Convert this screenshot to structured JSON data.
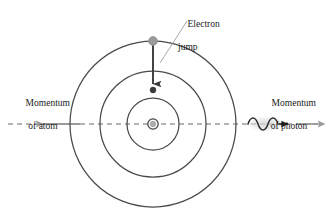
{
  "figure": {
    "background_color": "#ffffff",
    "width": 329,
    "height": 218
  },
  "labels": {
    "electron_jump": {
      "line1": "Electron",
      "line2": "jump"
    },
    "momentum_atom": {
      "line1": "Momentum",
      "line2": "of atom"
    },
    "momentum_photon": {
      "line1": "Momentum",
      "line2": "of photon"
    }
  },
  "atom": {
    "center_x": 153,
    "center_y": 124,
    "orbits": [
      {
        "name": "outer-orbit",
        "radius": 83
      },
      {
        "name": "middle-orbit",
        "radius": 53
      },
      {
        "name": "inner-orbit",
        "radius": 26
      }
    ],
    "nucleus": {
      "outer_radius": 5.2,
      "inner_radius": 2.6,
      "ring_color": "#3d3d3d",
      "fill_color": "#b0b0b0"
    },
    "electron_start": {
      "x": 153,
      "y": 41,
      "radius": 4.4,
      "color": "#9a9a9a"
    },
    "electron_end": {
      "x": 153,
      "y": 90,
      "radius": 2.8,
      "color": "#3a3a3a"
    },
    "jump_arrow": {
      "from_y": 45,
      "to_y": 86,
      "color": "#3a3a3a"
    }
  },
  "axis": {
    "y": 124,
    "from_x": 8,
    "to_x": 322,
    "color": "#9a9a9a",
    "dash": "5 4"
  },
  "momentum_atom_arrow": {
    "tail_x": 80,
    "head_x": 32,
    "y": 124,
    "color": "#9a9a9a"
  },
  "photon": {
    "squiggle_start_x": 248,
    "squiggle_end_x": 280,
    "y": 124,
    "amplitude": 5,
    "cycles": 3,
    "color": "#2a2a2a",
    "halo_color": "#dcdcdc",
    "arrow_head_x": 292,
    "gray_arrow_tail_x": 296,
    "gray_arrow_head_x": 324,
    "gray_color": "#9a9a9a"
  },
  "leader_line": {
    "from_x": 160,
    "from_y": 62,
    "to_x": 186,
    "to_y": 22,
    "color": "#9a9a9a"
  },
  "colors": {
    "orbit_stroke": "#4a4a4a",
    "text": "#1b1b1b",
    "gray_accent": "#9a9a9a",
    "dark_accent": "#2a2a2a"
  }
}
